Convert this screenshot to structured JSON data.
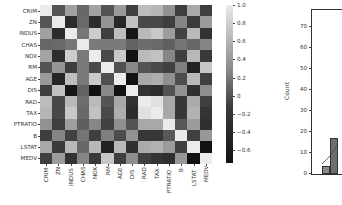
{
  "chart_data": [
    {
      "type": "heatmap",
      "title": "",
      "labels": [
        "CRIM",
        "ZN",
        "INDUS",
        "CHAS",
        "NOX",
        "RM",
        "AGE",
        "DIS",
        "RAD",
        "TAX",
        "PTRATIO",
        "B",
        "LSTAT",
        "MEDV"
      ],
      "values": [
        [
          1.0,
          -0.2,
          0.41,
          -0.06,
          0.42,
          -0.22,
          0.35,
          -0.38,
          0.63,
          0.58,
          0.29,
          -0.39,
          0.46,
          -0.39
        ],
        [
          -0.2,
          1.0,
          -0.53,
          -0.04,
          -0.52,
          0.31,
          -0.57,
          0.66,
          -0.31,
          -0.31,
          -0.39,
          0.18,
          -0.41,
          0.36
        ],
        [
          0.41,
          -0.53,
          1.0,
          0.06,
          0.76,
          -0.39,
          0.64,
          -0.71,
          0.6,
          0.72,
          0.38,
          -0.36,
          0.6,
          -0.48
        ],
        [
          -0.06,
          -0.04,
          0.06,
          1.0,
          0.09,
          0.09,
          0.09,
          -0.1,
          -0.01,
          -0.04,
          -0.12,
          0.05,
          -0.05,
          0.18
        ],
        [
          0.42,
          -0.52,
          0.76,
          0.09,
          1.0,
          -0.3,
          0.73,
          -0.77,
          0.61,
          0.67,
          0.19,
          -0.38,
          0.59,
          -0.43
        ],
        [
          -0.22,
          0.31,
          -0.39,
          0.09,
          -0.3,
          1.0,
          -0.24,
          0.21,
          -0.21,
          -0.29,
          -0.36,
          0.13,
          -0.61,
          0.7
        ],
        [
          0.35,
          -0.57,
          0.64,
          0.09,
          0.73,
          -0.24,
          1.0,
          -0.75,
          0.46,
          0.51,
          0.26,
          -0.27,
          0.6,
          -0.38
        ],
        [
          -0.38,
          0.66,
          -0.71,
          -0.1,
          -0.77,
          0.21,
          -0.75,
          1.0,
          -0.49,
          -0.53,
          -0.23,
          0.29,
          -0.5,
          0.25
        ],
        [
          0.63,
          -0.31,
          0.6,
          -0.01,
          0.61,
          -0.21,
          0.46,
          -0.49,
          1.0,
          0.91,
          0.46,
          -0.44,
          0.49,
          -0.38
        ],
        [
          0.58,
          -0.31,
          0.72,
          -0.04,
          0.67,
          -0.29,
          0.51,
          -0.53,
          0.91,
          1.0,
          0.46,
          -0.44,
          0.54,
          -0.47
        ],
        [
          0.29,
          -0.39,
          0.38,
          -0.12,
          0.19,
          -0.36,
          0.26,
          -0.23,
          0.46,
          0.46,
          1.0,
          -0.18,
          0.37,
          -0.51
        ],
        [
          -0.39,
          0.18,
          -0.36,
          0.05,
          -0.38,
          0.13,
          -0.27,
          0.29,
          -0.44,
          -0.44,
          -0.18,
          1.0,
          -0.37,
          0.33
        ],
        [
          0.46,
          -0.41,
          0.6,
          -0.05,
          0.59,
          -0.61,
          0.6,
          -0.5,
          0.49,
          0.54,
          0.37,
          -0.37,
          1.0,
          -0.74
        ],
        [
          -0.39,
          0.36,
          -0.48,
          0.18,
          -0.43,
          0.7,
          -0.38,
          0.25,
          -0.38,
          -0.47,
          -0.51,
          0.33,
          -0.74,
          1.0
        ]
      ],
      "colorbar": {
        "ticks": [
          "1.0",
          "0.8",
          "0.6",
          "0.4",
          "0.2",
          "0",
          "−0.2",
          "−0.4",
          "−0.6"
        ],
        "range": [
          -0.74,
          1.0
        ],
        "colormap": "gray"
      },
      "xlabel": "",
      "ylabel": ""
    },
    {
      "type": "bar",
      "title": "",
      "xlabel": "",
      "ylabel": "Count",
      "ylim": [
        0,
        78
      ],
      "yticks": [
        "0",
        "10",
        "20",
        "30",
        "40",
        "50",
        "60",
        "70"
      ],
      "partially_visible": true,
      "visible_bars": [
        {
          "bin": 1,
          "count": 4
        },
        {
          "bin": 2,
          "count": 17
        }
      ]
    }
  ],
  "heatmap": {
    "row_labels": [
      "CRIM",
      "ZN",
      "INDUS",
      "CHAS",
      "NOX",
      "RM",
      "AGE",
      "DIS",
      "RAD",
      "TAX",
      "PTRATIO",
      "B",
      "LSTAT",
      "MEDV"
    ],
    "col_labels": [
      "CRIM",
      "ZN",
      "INDUS",
      "CHAS",
      "NOX",
      "RM",
      "AGE",
      "DIS",
      "RAD",
      "TAX",
      "PTRATIO",
      "B",
      "LSTAT",
      "MEDV"
    ]
  },
  "colorbar": {
    "labels": [
      "1.0",
      "0.8",
      "0.6",
      "0.4",
      "0.2",
      "0",
      "−0.2",
      "−0.4",
      "−0.6"
    ]
  },
  "histogram": {
    "ylabel": "Count",
    "yticks": [
      "70",
      "60",
      "50",
      "40",
      "30",
      "20",
      "10",
      "0"
    ]
  }
}
